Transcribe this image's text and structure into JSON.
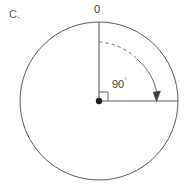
{
  "figure": {
    "panel_letter": "C.",
    "top_label": "0",
    "angle_value": "90",
    "angle_unit": "°",
    "center_point_name": "center-dot",
    "background_color": "#ffffff",
    "stroke_color": "#555555",
    "text_color": "#3d3d3d",
    "circle": {
      "center_x": 99,
      "center_y": 101,
      "radius": 79
    },
    "radii": [
      {
        "name": "vertical-radius",
        "label": "0",
        "angle_deg": 0
      },
      {
        "name": "horizontal-radius",
        "label": "",
        "angle_deg": 90
      }
    ],
    "arc": {
      "name": "rotation-arc",
      "style": "dashed-to-solid",
      "sweep_deg": 90,
      "arrow_direction": "clockwise",
      "arrow_end": "down"
    },
    "right_angle_marker": {
      "name": "right-angle-square",
      "size": 9
    }
  }
}
